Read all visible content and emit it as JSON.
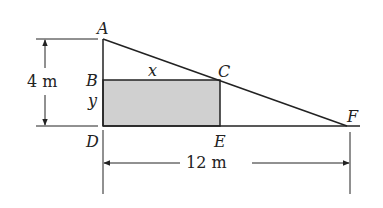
{
  "diagram": {
    "points": {
      "A": {
        "label": "A",
        "x": 103,
        "y": 39
      },
      "B": {
        "label": "B",
        "x": 103,
        "y": 80
      },
      "C": {
        "label": "C",
        "x": 220,
        "y": 80
      },
      "D": {
        "label": "D",
        "x": 103,
        "y": 126
      },
      "E": {
        "label": "E",
        "x": 220,
        "y": 126
      },
      "F": {
        "label": "F",
        "x": 347,
        "y": 126
      }
    },
    "variables": {
      "x": "x",
      "y": "y"
    },
    "dimensions": {
      "height": "4 m",
      "base": "12 m"
    },
    "colors": {
      "line": "#222222",
      "shade": "#d0d0d0"
    }
  }
}
